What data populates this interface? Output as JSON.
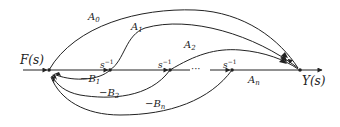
{
  "diagram": {
    "type": "signal-flow-graph",
    "input": {
      "label": "F(s)"
    },
    "output": {
      "label": "Y(s)"
    },
    "forward_branches": [
      {
        "id": "A0",
        "label_base": "A",
        "label_sub": "0",
        "from": "input-node",
        "to": "output-node"
      },
      {
        "id": "A1",
        "label_base": "A",
        "label_sub": "1",
        "from": "node-1",
        "to": "output-node"
      },
      {
        "id": "A2",
        "label_base": "A",
        "label_sub": "2",
        "from": "node-2",
        "to": "output-node"
      },
      {
        "id": "An",
        "label_base": "A",
        "label_sub": "n",
        "from": "node-n",
        "to": "output-node"
      }
    ],
    "integrators": [
      {
        "label_base": "s",
        "label_sup": "−1"
      },
      {
        "label_base": "s",
        "label_sup": "−1"
      },
      {
        "label_base": "s",
        "label_sup": "−1"
      }
    ],
    "ellipsis": "···",
    "feedback_branches": [
      {
        "id": "B1",
        "label_prefix": "−",
        "label_base": "B",
        "label_sub": "1"
      },
      {
        "id": "B2",
        "label_prefix": "−",
        "label_base": "B",
        "label_sub": "2"
      },
      {
        "id": "Bn",
        "label_prefix": "−",
        "label_base": "B",
        "label_sub": "n"
      }
    ],
    "colors": {
      "line": "#222222",
      "background": "#ffffff"
    }
  }
}
